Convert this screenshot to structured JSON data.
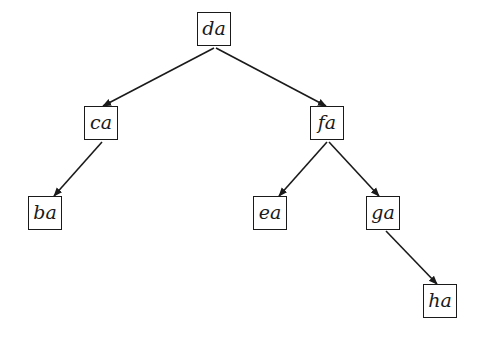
{
  "diagram": {
    "type": "binary-search-tree",
    "nodes": [
      {
        "id": "da",
        "label": "da",
        "x": 197,
        "y": 12
      },
      {
        "id": "ca",
        "label": "ca",
        "x": 84,
        "y": 106
      },
      {
        "id": "fa",
        "label": "fa",
        "x": 310,
        "y": 106
      },
      {
        "id": "ba",
        "label": "ba",
        "x": 28,
        "y": 196
      },
      {
        "id": "ea",
        "label": "ea",
        "x": 253,
        "y": 196
      },
      {
        "id": "ga",
        "label": "ga",
        "x": 366,
        "y": 196
      },
      {
        "id": "ha",
        "label": "ha",
        "x": 423,
        "y": 284
      }
    ],
    "edges": [
      {
        "from": "da",
        "to": "ca",
        "x1": 214,
        "y1": 48,
        "x2": 103,
        "y2": 106
      },
      {
        "from": "da",
        "to": "fa",
        "x1": 216,
        "y1": 48,
        "x2": 326,
        "y2": 106
      },
      {
        "from": "ca",
        "to": "ba",
        "x1": 102,
        "y1": 142,
        "x2": 54,
        "y2": 196
      },
      {
        "from": "fa",
        "to": "ea",
        "x1": 327,
        "y1": 142,
        "x2": 279,
        "y2": 196
      },
      {
        "from": "fa",
        "to": "ga",
        "x1": 329,
        "y1": 142,
        "x2": 379,
        "y2": 196
      },
      {
        "from": "ga",
        "to": "ha",
        "x1": 386,
        "y1": 231,
        "x2": 437,
        "y2": 284
      }
    ],
    "colors": {
      "stroke": "#1a1a1a",
      "background": "#ffffff"
    }
  }
}
